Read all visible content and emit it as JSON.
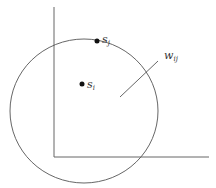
{
  "diagram": {
    "labels": {
      "s_j": {
        "base": "s",
        "sub": "j"
      },
      "s_i": {
        "base": "s",
        "sub": "i"
      },
      "w_ij": {
        "base": "w",
        "sub": "ij"
      }
    },
    "colors": {
      "stroke": "#555555",
      "point": "#111111"
    }
  }
}
